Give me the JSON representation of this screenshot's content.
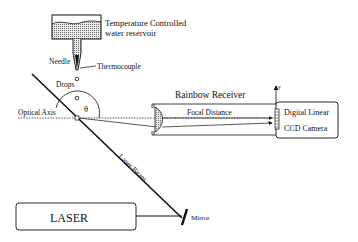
{
  "diagram": {
    "reservoir": {
      "label_line1": "Temperature Controlled",
      "label_line2": "water reservoir"
    },
    "needle_label": "Needle",
    "thermocouple_label": "Thermocouple",
    "drops_label": "Drops",
    "optical_axis_label": "Optical Axis",
    "angle_label": "θ",
    "receiver": {
      "title": "Rainbow Receiver",
      "focal_label": "Focal Distance"
    },
    "camera": {
      "line1": "Digital Linear",
      "line2": "CCD Camera",
      "axis_label": "y"
    },
    "laser_beam_label": "Laser Beam",
    "laser_label": "LASER",
    "mirror_label": "Mirror"
  },
  "colors": {
    "ink": "#111111",
    "hatch": "#9a9a9a",
    "background": "#ffffff"
  }
}
